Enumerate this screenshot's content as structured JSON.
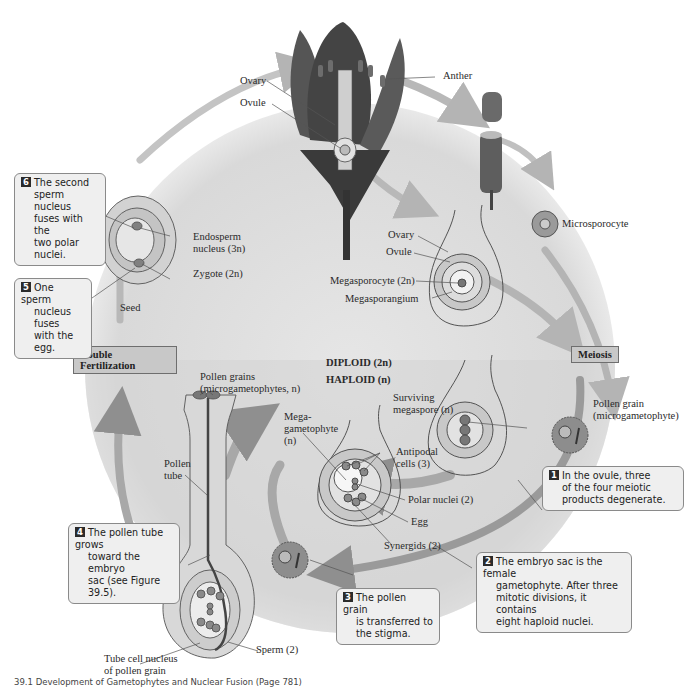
{
  "figure": {
    "caption": "39.1  Development of Gametophytes and Nuclear Fusion  (Page 781)"
  },
  "phases": {
    "diploid": "DIPLOID (2n)",
    "haploid": "HAPLOID (n)",
    "double_fertilization": "Double Fertilization",
    "meiosis": "Meiosis"
  },
  "flower_labels": {
    "ovary": "Ovary",
    "ovule": "Ovule",
    "anther": "Anther"
  },
  "structure_labels": {
    "microsporocyte": "Microsporocyte",
    "ovary2": "Ovary",
    "ovule2": "Ovule",
    "megasporocyte": "Megasporocyte (2n)",
    "megasporangium": "Megasporangium",
    "endosperm_1": "Endosperm",
    "endosperm_2": "nucleus (3n)",
    "zygote": "Zygote (2n)",
    "seed": "Seed",
    "pollen_grain_1": "Pollen grain",
    "pollen_grain_2": "(microgametophyte)",
    "surviving_1": "Surviving",
    "surviving_2": "megaspore (n)",
    "megagam_1": "Mega-",
    "megagam_2": "gametophyte",
    "megagam_3": "(n)",
    "antipodal_1": "Antipodal",
    "antipodal_2": "cells (3)",
    "polar_nuclei": "Polar nuclei (2)",
    "egg": "Egg",
    "synergids": "Synergids (2)",
    "pollen_grains_1": "Pollen grains",
    "pollen_grains_2": "(microgametophytes, n)",
    "pollen_tube_1": "Pollen",
    "pollen_tube_2": "tube",
    "sperm": "Sperm (2)",
    "tube_cell_1": "Tube cell nucleus",
    "tube_cell_2": "of pollen grain"
  },
  "callouts": [
    {
      "step": "1",
      "lines": [
        "In the ovule, three",
        "of the four meiotic",
        "products degenerate."
      ]
    },
    {
      "step": "2",
      "lines": [
        "The embryo sac is the female",
        "gametophyte. After three",
        "mitotic divisions, it contains",
        "eight haploid nuclei."
      ]
    },
    {
      "step": "3",
      "lines": [
        "The pollen grain",
        "is transferred to",
        "the stigma."
      ]
    },
    {
      "step": "4",
      "lines": [
        "The pollen tube grows",
        "toward the embryo",
        "sac (see Figure 39.5)."
      ]
    },
    {
      "step": "5",
      "lines": [
        "One sperm",
        "nucleus fuses",
        "with the egg."
      ]
    },
    {
      "step": "6",
      "lines": [
        "The second",
        "sperm nucleus",
        "fuses with the",
        "two polar nuclei."
      ]
    }
  ],
  "colors": {
    "background": "#ffffff",
    "diploid_zone": "#e4e4e4",
    "haploid_zone": "#d6d6d6",
    "arrow": "#b4b4b4",
    "arrow_dark": "#8f8f8f",
    "callout_fill": "#efefef",
    "phase_box_fill": "#c8c8c8"
  }
}
